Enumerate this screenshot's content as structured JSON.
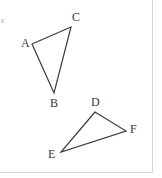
{
  "figure": {
    "canvas": {
      "width": 162,
      "height": 178,
      "background": "#ffffff"
    },
    "stroke_color": "#3c3c3c",
    "label_color": "#3a3a3a",
    "border_color": "#d6d6d6",
    "triangles": [
      {
        "name": "triangle-abc",
        "vertices": [
          {
            "id": "A",
            "label": "A",
            "x": 32,
            "y": 44,
            "label_x": 21,
            "label_y": 37
          },
          {
            "id": "B",
            "label": "B",
            "x": 54,
            "y": 93,
            "label_x": 50,
            "label_y": 97
          },
          {
            "id": "C",
            "label": "C",
            "x": 71,
            "y": 27,
            "label_x": 72,
            "label_y": 11
          }
        ],
        "edges": [
          "A-C",
          "C-B",
          "B-A"
        ]
      },
      {
        "name": "triangle-def",
        "vertices": [
          {
            "id": "D",
            "label": "D",
            "x": 95,
            "y": 112,
            "label_x": 91,
            "label_y": 96
          },
          {
            "id": "E",
            "label": "E",
            "x": 61,
            "y": 152,
            "label_x": 48,
            "label_y": 148
          },
          {
            "id": "F",
            "label": "F",
            "x": 126,
            "y": 131,
            "label_x": 130,
            "label_y": 123
          }
        ],
        "edges": [
          "D-E",
          "D-F",
          "E-F"
        ]
      }
    ],
    "paths": {
      "triangle_abc": "M 32 44 L 71 27 L 54 93 Z",
      "triangle_def": "M 95 112 L 61 152 L 126 131 Z"
    }
  }
}
